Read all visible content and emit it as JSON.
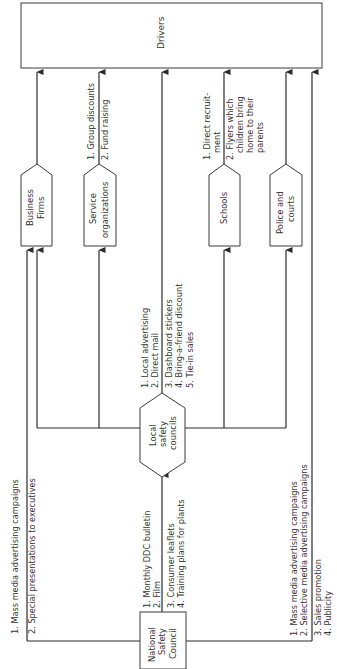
{
  "diagram": {
    "orientation": "rotated-90-ccw",
    "target": {
      "label": "Drivers"
    },
    "source": {
      "label_lines": [
        "National",
        "Safety",
        "Council"
      ]
    },
    "source_labels": {
      "upper_left": [
        "1. Mass media advertising campaigns",
        "2. Special presentations to executives"
      ],
      "to_local_a": [
        "1. Monthly DDC bulletin",
        "2. Film"
      ],
      "to_local_b": [
        "3. Consumer leaflets",
        "4. Training plans for plants"
      ],
      "right_a": [
        "1. Mass media advertising campaigns",
        "2. Selective media advertising campaigns"
      ],
      "right_b": [
        "3. Sales promotion",
        "4. Publicity"
      ]
    },
    "hub": {
      "label_lines": [
        "Local",
        "safety",
        "councils"
      ],
      "labels_a": [
        "1. Local advertising",
        "2. Direct mail"
      ],
      "labels_b": [
        "3. Dashboard stickers",
        "4. Bring-a-friend discount",
        "5. Tie-in sales"
      ]
    },
    "intermediaries": [
      {
        "label_lines": [
          "Business",
          "Firms"
        ],
        "labels": []
      },
      {
        "label_lines": [
          "Service",
          "organizations"
        ],
        "labels": [
          "1. Group discounts",
          "2. Fund raising"
        ]
      },
      {
        "label_lines": [
          "Schools"
        ],
        "labels": [
          "1. Direct recruit-",
          "ment",
          "2. Flyers which",
          "children bring",
          "home to their",
          "parents"
        ]
      },
      {
        "label_lines": [
          "Police and",
          "courts"
        ],
        "labels": []
      }
    ],
    "colors": {
      "line": "#2a2a2a",
      "text": "#333333",
      "background": "#ffffff"
    }
  }
}
